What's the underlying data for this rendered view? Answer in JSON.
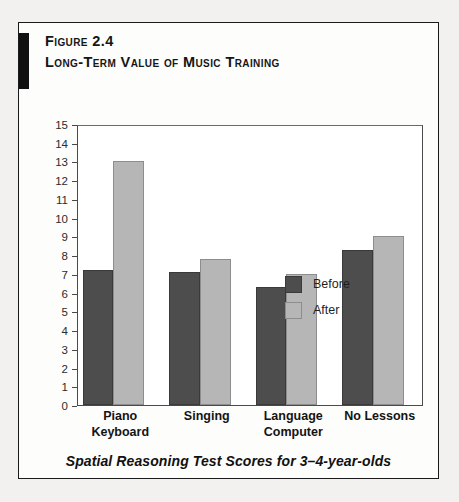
{
  "figure": {
    "number": "Figure 2.4",
    "title": "Long-Term Value of Music Training",
    "caption": "Spatial Reasoning Test Scores for 3–4-year-olds"
  },
  "colors": {
    "before": "#4d4d4d",
    "after": "#b6b6b6",
    "accent_bar": "#111111",
    "border": "#1a1a1a",
    "page_background": "#f2f1ef"
  },
  "legend": {
    "position": "inside-top-right",
    "entries": [
      {
        "label": "Before",
        "swatch": "before"
      },
      {
        "label": "After",
        "swatch": "after"
      }
    ]
  },
  "chart_data": {
    "type": "bar",
    "title": "Long-Term Value of Music Training",
    "subtitle": "Spatial Reasoning Test Scores for 3–4-year-olds",
    "categories": [
      "Piano Keyboard",
      "Singing",
      "Language Computer",
      "No Lessons"
    ],
    "category_lines": [
      [
        "Piano",
        "Keyboard"
      ],
      [
        "Singing"
      ],
      [
        "Language",
        "Computer"
      ],
      [
        "No Lessons"
      ]
    ],
    "series": [
      {
        "name": "Before",
        "values": [
          7.2,
          7.1,
          6.3,
          8.3
        ]
      },
      {
        "name": "After",
        "values": [
          13.0,
          7.8,
          7.0,
          9.0
        ]
      }
    ],
    "xlabel": "",
    "ylabel": "",
    "ylim": [
      0,
      15
    ],
    "yticks": [
      15,
      14,
      13,
      12,
      11,
      10,
      9,
      8,
      7,
      6,
      5,
      4,
      3,
      2,
      1,
      0
    ],
    "grid": false,
    "legend_position": "inside-top-right"
  }
}
